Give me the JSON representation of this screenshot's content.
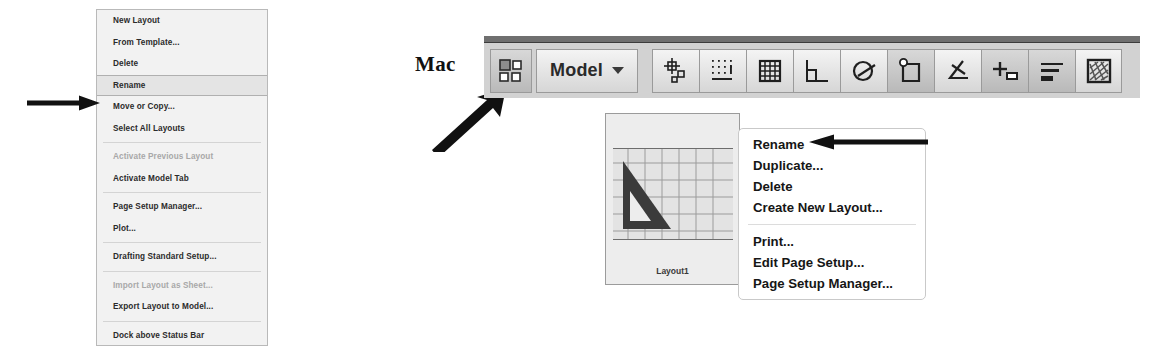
{
  "windows_menu": {
    "name": "windows-layout-context-menu",
    "items": [
      {
        "label": "New Layout",
        "state": "normal",
        "sep_before": false
      },
      {
        "label": "From Template...",
        "state": "normal",
        "sep_before": false
      },
      {
        "label": "Delete",
        "state": "normal",
        "sep_before": false
      },
      {
        "label": "Rename",
        "state": "selected",
        "sep_before": false
      },
      {
        "label": "Move or Copy...",
        "state": "normal",
        "sep_before": false
      },
      {
        "label": "Select All Layouts",
        "state": "normal",
        "sep_before": false
      },
      {
        "label": "Activate Previous Layout",
        "state": "disabled",
        "sep_before": true
      },
      {
        "label": "Activate Model Tab",
        "state": "normal",
        "sep_before": false
      },
      {
        "label": "Page Setup Manager...",
        "state": "normal",
        "sep_before": true
      },
      {
        "label": "Plot...",
        "state": "normal",
        "sep_before": false
      },
      {
        "label": "Drafting Standard Setup...",
        "state": "normal",
        "sep_before": true
      },
      {
        "label": "Import Layout as Sheet...",
        "state": "disabled",
        "sep_before": true
      },
      {
        "label": "Export Layout to Model...",
        "state": "normal",
        "sep_before": false
      },
      {
        "label": "Dock above Status Bar",
        "state": "normal",
        "sep_before": true
      }
    ]
  },
  "mac_label": {
    "text": "Mac"
  },
  "toolbar": {
    "layout_button": {
      "icon": "layout-grid-icon"
    },
    "model_button": {
      "label": "Model",
      "icon": "chevron-down-icon"
    },
    "status_buttons": [
      {
        "icon": "snap-mode-icon",
        "active": false
      },
      {
        "icon": "grid-display-icon",
        "active": false
      },
      {
        "icon": "grid-snap-icon",
        "active": false
      },
      {
        "icon": "ortho-mode-icon",
        "active": false
      },
      {
        "icon": "polar-tracking-icon",
        "active": false
      },
      {
        "icon": "object-snap-icon",
        "active": true
      },
      {
        "icon": "object-snap-tracking-icon",
        "active": false
      },
      {
        "icon": "dynamic-ucs-icon",
        "active": true
      },
      {
        "icon": "lineweight-icon",
        "active": true
      },
      {
        "icon": "transparency-icon",
        "active": false
      }
    ]
  },
  "layout_thumbnail": {
    "label": "Layout1",
    "preview_icon": "triangle-set-square-icon"
  },
  "mac_menu": {
    "name": "mac-layout-context-menu",
    "items": [
      {
        "label": "Rename",
        "sep_before": false
      },
      {
        "label": "Duplicate...",
        "sep_before": false
      },
      {
        "label": "Delete",
        "sep_before": false
      },
      {
        "label": "Create New Layout...",
        "sep_before": false
      },
      {
        "label": "Print...",
        "sep_before": true
      },
      {
        "label": "Edit Page Setup...",
        "sep_before": false
      },
      {
        "label": "Page Setup Manager...",
        "sep_before": false
      }
    ]
  },
  "annotations": {
    "arrow_to_windows_rename": "arrow-right-icon",
    "arrow_to_layout_button": "arrow-diagonal-up-right-icon",
    "arrow_to_mac_rename": "arrow-left-icon"
  },
  "colors": {
    "menu_bg": "#f2f2f2",
    "menu_border": "#b9b9b9",
    "selected_row": "#e4e4e4",
    "disabled_text": "#a8a8a8",
    "toolbar_bg": "#d2d2d2",
    "arrow": "#111111"
  }
}
